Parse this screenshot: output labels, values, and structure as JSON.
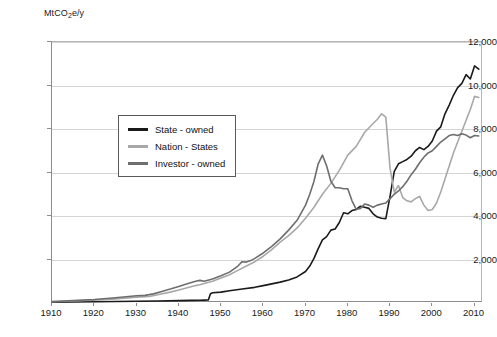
{
  "chart_data": {
    "type": "line",
    "title": "",
    "xlabel": "",
    "ylabel": "MtCO2e/y",
    "ylabel_html": "MtCO<sub>2</sub>e/y",
    "xlim": [
      1910,
      2012
    ],
    "ylim": [
      0,
      12000
    ],
    "grid": true,
    "legend_position": "upper-left-inside",
    "y_ticks": [
      "0",
      "2,000",
      "4,000",
      "6,000",
      "8,000",
      "10,000",
      "12,000"
    ],
    "y_tick_values": [
      0,
      2000,
      4000,
      6000,
      8000,
      10000,
      12000
    ],
    "x_ticks": [
      "1910",
      "1920",
      "1930",
      "1940",
      "1950",
      "1960",
      "1970",
      "1980",
      "1990",
      "2000",
      "2010"
    ],
    "x_tick_values": [
      1910,
      1920,
      1930,
      1940,
      1950,
      1960,
      1970,
      1980,
      1990,
      2000,
      2010
    ],
    "colors": {
      "state_owned": "#1a1a1a",
      "nation_states": "#a8a8a8",
      "investor_owned": "#6e6e6e",
      "gridline": "#d4d4d4",
      "axis": "#8c8c8c",
      "background": "#ffffff"
    },
    "series": [
      {
        "name": "State-owned",
        "color": "#1a1a1a",
        "x": [
          1910,
          1915,
          1920,
          1925,
          1930,
          1935,
          1940,
          1943,
          1945,
          1946,
          1947,
          1947.5,
          1948,
          1950,
          1952,
          1955,
          1958,
          1960,
          1962,
          1964,
          1966,
          1968,
          1970,
          1971,
          1972,
          1973,
          1974,
          1975,
          1976,
          1977,
          1978,
          1979,
          1980,
          1981,
          1982,
          1983,
          1984,
          1985,
          1986,
          1987,
          1988,
          1989,
          1990,
          1991,
          1992,
          1993,
          1994,
          1995,
          1996,
          1997,
          1998,
          1999,
          2000,
          2001,
          2002,
          2003,
          2004,
          2005,
          2006,
          2007,
          2008,
          2009,
          2010,
          2011
        ],
        "y": [
          40,
          50,
          60,
          70,
          80,
          95,
          110,
          120,
          125,
          130,
          135,
          430,
          470,
          500,
          560,
          640,
          720,
          800,
          880,
          960,
          1060,
          1200,
          1450,
          1700,
          2050,
          2500,
          2900,
          3050,
          3350,
          3400,
          3700,
          4150,
          4100,
          4250,
          4300,
          4450,
          4400,
          4350,
          4100,
          3950,
          3900,
          3880,
          4900,
          6050,
          6400,
          6500,
          6600,
          6750,
          7000,
          7150,
          7050,
          7200,
          7450,
          7900,
          8100,
          8700,
          9100,
          9550,
          9900,
          10100,
          10500,
          10300,
          10900,
          10750
        ]
      },
      {
        "name": "Nation-States",
        "color": "#a8a8a8",
        "x": [
          1910,
          1915,
          1920,
          1925,
          1930,
          1933,
          1935,
          1938,
          1940,
          1942,
          1944,
          1945,
          1946,
          1948,
          1950,
          1952,
          1954,
          1956,
          1958,
          1960,
          1962,
          1964,
          1966,
          1968,
          1970,
          1972,
          1974,
          1976,
          1978,
          1980,
          1982,
          1984,
          1986,
          1987,
          1988,
          1989,
          1990,
          1991,
          1992,
          1993,
          1994,
          1995,
          1996,
          1997,
          1998,
          1999,
          2000,
          2001,
          2002,
          2003,
          2004,
          2005,
          2006,
          2007,
          2008,
          2009,
          2010,
          2011
        ],
        "y": [
          60,
          90,
          130,
          190,
          270,
          300,
          380,
          500,
          600,
          700,
          800,
          840,
          900,
          1000,
          1150,
          1300,
          1500,
          1700,
          1900,
          2150,
          2450,
          2800,
          3100,
          3450,
          3900,
          4400,
          5000,
          5500,
          6100,
          6800,
          7200,
          7850,
          8250,
          8450,
          8700,
          8550,
          6200,
          5100,
          5400,
          4850,
          4700,
          4650,
          4800,
          4900,
          4500,
          4250,
          4300,
          4600,
          5100,
          5700,
          6300,
          6900,
          7400,
          7900,
          8400,
          8900,
          9500,
          9450
        ]
      },
      {
        "name": "Investor-owned",
        "color": "#6e6e6e",
        "x": [
          1910,
          1915,
          1920,
          1925,
          1930,
          1932,
          1934,
          1936,
          1938,
          1940,
          1942,
          1944,
          1945,
          1946,
          1948,
          1950,
          1952,
          1954,
          1955,
          1956,
          1957,
          1958,
          1960,
          1962,
          1964,
          1966,
          1968,
          1970,
          1971,
          1972,
          1973,
          1974,
          1975,
          1976,
          1977,
          1978,
          1979,
          1980,
          1981,
          1982,
          1983,
          1984,
          1985,
          1986,
          1987,
          1988,
          1989,
          1990,
          1991,
          1992,
          1993,
          1994,
          1995,
          1996,
          1997,
          1998,
          1999,
          2000,
          2001,
          2002,
          2003,
          2004,
          2005,
          2006,
          2007,
          2008,
          2009,
          2010,
          2011
        ],
        "y": [
          70,
          110,
          160,
          240,
          330,
          350,
          420,
          530,
          640,
          760,
          880,
          1000,
          1040,
          1000,
          1100,
          1250,
          1420,
          1700,
          1900,
          1880,
          1950,
          2050,
          2300,
          2600,
          2950,
          3350,
          3800,
          4500,
          5000,
          5600,
          6400,
          6800,
          6300,
          5600,
          5300,
          5300,
          5250,
          5250,
          4700,
          4300,
          4350,
          4550,
          4500,
          4400,
          4500,
          4550,
          4600,
          4800,
          5000,
          5150,
          5350,
          5600,
          5900,
          6150,
          6450,
          6700,
          6900,
          7000,
          7200,
          7400,
          7550,
          7700,
          7750,
          7700,
          7780,
          7720,
          7600,
          7700,
          7680
        ]
      }
    ],
    "annotations": {
      "investor_owned_peak": {
        "year": 1974,
        "value": 6800
      },
      "nation_states_peak": {
        "year": 1988,
        "value": 8700
      },
      "state_owned_step": {
        "year": 1947,
        "value": 430
      }
    }
  },
  "legend": {
    "entries": [
      {
        "label": "State - owned",
        "color": "#1a1a1a"
      },
      {
        "label": "Nation - States",
        "color": "#a8a8a8"
      },
      {
        "label": "Investor - owned",
        "color": "#6e6e6e"
      }
    ]
  }
}
